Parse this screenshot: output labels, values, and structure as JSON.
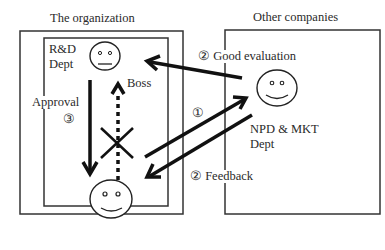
{
  "groups": {
    "organization": {
      "title": "The organization",
      "dept": [
        "R&D",
        "Dept"
      ]
    },
    "other": {
      "title": "Other companies"
    }
  },
  "actors": {
    "boss": {
      "label": "Boss",
      "expression": "neutral"
    },
    "subordinate": {
      "expression": "smile"
    },
    "npd": {
      "label": [
        "NPD & MKT",
        "Dept"
      ],
      "expression": "smile"
    }
  },
  "flows": {
    "good_evaluation": "② Good evaluation",
    "step1": "①",
    "feedback": "② Feedback",
    "approval": "Approval",
    "step3": "③"
  },
  "blocked_marker": "cross-icon"
}
